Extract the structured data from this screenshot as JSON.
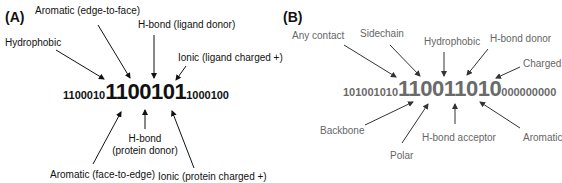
{
  "panel_a": {
    "tag": "(A)",
    "text_color": "#111111",
    "binary": {
      "prefix": "1100010",
      "highlight": "1100101",
      "suffix": "1000100"
    },
    "labels": {
      "aromatic_edge_to_face": "Aromatic (edge-to-face)",
      "hydrophobic": "Hydrophobic",
      "hbond_ligand_donor": "H-bond (ligand donor)",
      "ionic_ligand_charged": "Ionic (ligand charged +)",
      "hbond_protein_donor_line1": "H-bond",
      "hbond_protein_donor_line2": "(protein donor)",
      "aromatic_face_to_edge": "Aromatic (face-to-edge)",
      "ionic_protein_charged": "Ionic (protein charged +)"
    }
  },
  "panel_b": {
    "tag": "(B)",
    "text_color": "#666666",
    "binary": {
      "prefix": "101001010",
      "highlight": "110011010",
      "suffix": "000000000"
    },
    "labels": {
      "any_contact": "Any contact",
      "sidechain": "Sidechain",
      "hydrophobic": "Hydrophobic",
      "hbond_donor": "H-bond donor",
      "charged": "Charged",
      "backbone": "Backbone",
      "polar": "Polar",
      "hbond_acceptor": "H-bond acceptor",
      "aromatic": "Aromatic"
    }
  }
}
